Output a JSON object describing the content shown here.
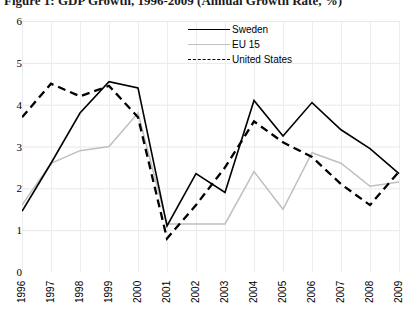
{
  "chart_data": {
    "type": "line",
    "title": "Figure 1: GDP Growth, 1996-2009 (Annual Growth Rate, %)",
    "xlabel": "",
    "ylabel": "",
    "ylim": [
      0,
      6
    ],
    "yticks": [
      0,
      1,
      2,
      3,
      4,
      5,
      6
    ],
    "ytick_labels": [
      "0",
      "1",
      "2",
      "3",
      "4",
      "5",
      "6"
    ],
    "grid": true,
    "legend_position": "top-right",
    "categories": [
      "1996",
      "1997",
      "1998",
      "1999",
      "2000",
      "2001",
      "2002",
      "2003",
      "2004",
      "2005",
      "2006",
      "2007",
      "2008",
      "2009"
    ],
    "series": [
      {
        "name": "Sweden",
        "color": "#000000",
        "style": "solid",
        "values": [
          1.45,
          2.6,
          3.8,
          4.55,
          4.4,
          1.1,
          2.35,
          1.9,
          4.1,
          3.25,
          4.05,
          3.4,
          2.95,
          2.35
        ]
      },
      {
        "name": "EU 15",
        "color": "#bfbfbf",
        "style": "solid",
        "values": [
          1.6,
          2.6,
          2.9,
          3.0,
          3.8,
          1.15,
          1.15,
          1.15,
          2.4,
          1.5,
          2.85,
          2.6,
          2.05,
          2.15
        ]
      },
      {
        "name": "United States",
        "color": "#000000",
        "style": "dashed",
        "values": [
          3.7,
          4.5,
          4.2,
          4.45,
          3.7,
          0.8,
          1.6,
          2.5,
          3.6,
          3.1,
          2.75,
          2.1,
          1.6,
          2.4
        ]
      }
    ]
  },
  "legend": {
    "items": [
      {
        "label": "Sweden"
      },
      {
        "label": "EU 15"
      },
      {
        "label": "United States"
      }
    ]
  }
}
